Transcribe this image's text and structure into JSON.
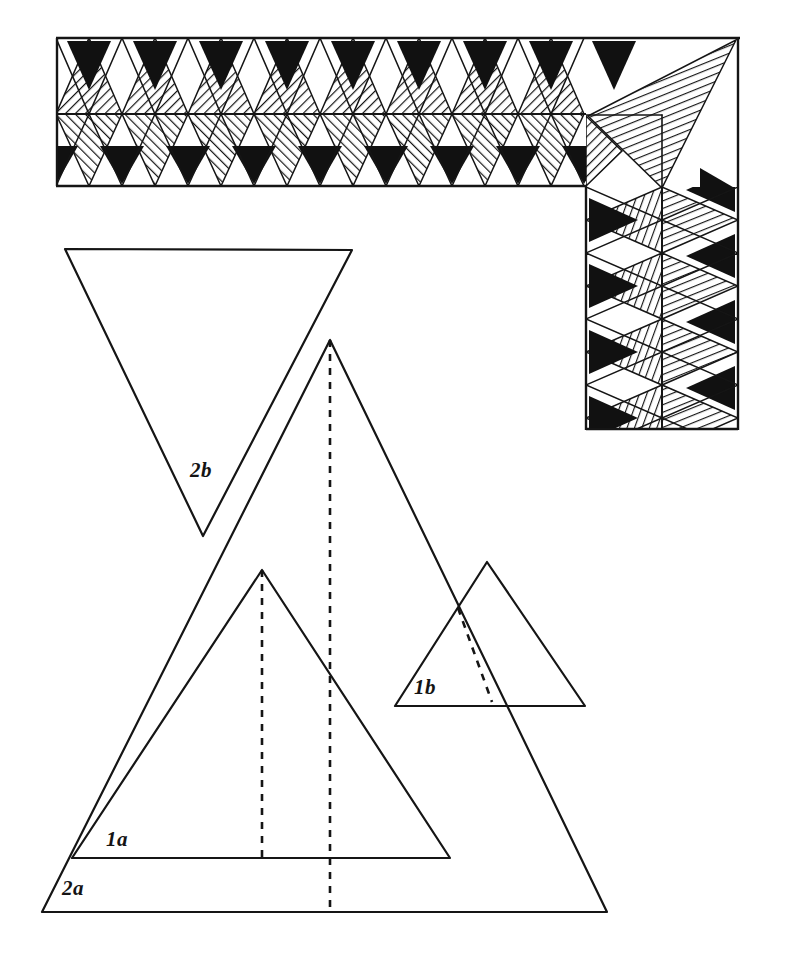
{
  "document": {
    "title": "Triangular Border Pattern Construction Diagram",
    "medium": "hand-drawn ink line drawing",
    "background_color": "#ffffff",
    "ink_color": "#151515",
    "fill_color": "#111111"
  },
  "border_pattern": {
    "name": "triangle frieze border",
    "description": "Two-row band of alternating hatched and solid-black triangles forming an L-shaped border with a corner block",
    "horizontal_band": {
      "x": 56,
      "y": 38,
      "width": 530,
      "height": 148,
      "midline_y": 114,
      "unit_width": 66,
      "rows": 2,
      "top_row_label": "upward hatched triangles alternating with white triangles holding solid black triangles",
      "bottom_row_label": "downward hatched triangles alternating with white triangles holding solid black triangles"
    },
    "vertical_band": {
      "x": 586,
      "y": 187,
      "width": 152,
      "height": 243,
      "midline_x": 662,
      "unit_height": 66,
      "columns": 2
    },
    "corner_block": {
      "x": 586,
      "y": 38,
      "width": 152,
      "height": 149,
      "motif": "large hatched triangle from top-right corner to bottom-left"
    },
    "hatch": {
      "angle_degrees": 45,
      "spacing_px": 5,
      "stroke_width": 1.6
    }
  },
  "construction_triangles": [
    {
      "id": "2b",
      "label": "2b",
      "orientation": "inverted",
      "label_x": 190,
      "label_y": 477,
      "vertices": [
        [
          65,
          249
        ],
        [
          352,
          250
        ],
        [
          203,
          536
        ]
      ],
      "has_dashed_line": false,
      "note": "large inverted outline triangle, upper left"
    },
    {
      "id": "2a",
      "label": "2a",
      "orientation": "upright",
      "label_x": 62,
      "label_y": 895,
      "vertices": [
        [
          330,
          340
        ],
        [
          42,
          912
        ],
        [
          607,
          912
        ]
      ],
      "has_dashed_line": true,
      "dashed_line": [
        [
          330,
          340
        ],
        [
          330,
          912
        ]
      ],
      "note": "largest upright outline triangle with dashed altitude"
    },
    {
      "id": "1a",
      "label": "1a",
      "orientation": "upright",
      "label_x": 106,
      "label_y": 846,
      "vertices": [
        [
          262,
          570
        ],
        [
          72,
          858
        ],
        [
          450,
          858
        ]
      ],
      "has_dashed_line": true,
      "dashed_line": [
        [
          262,
          570
        ],
        [
          262,
          858
        ]
      ],
      "note": "medium upright outline triangle with dashed altitude, nested inside 2a"
    },
    {
      "id": "1b",
      "label": "1b",
      "orientation": "upright",
      "label_x": 414,
      "label_y": 694,
      "vertices": [
        [
          487,
          562
        ],
        [
          395,
          706
        ],
        [
          585,
          706
        ]
      ],
      "has_dashed_line": true,
      "dashed_line": [
        [
          458,
          608
        ],
        [
          488,
          702
        ]
      ],
      "note": "small upright outline triangle at right with short dashed line"
    }
  ],
  "labels": {
    "one_a": "1a",
    "one_b": "1b",
    "two_a": "2a",
    "two_b": "2b"
  }
}
